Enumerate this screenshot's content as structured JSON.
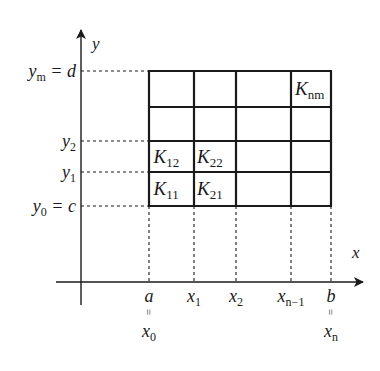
{
  "axes": {
    "x_label": "x",
    "y_label": "y"
  },
  "y_ticks": [
    {
      "name": "ym",
      "base": "y",
      "sub": "m",
      "suffix": " = d"
    },
    {
      "name": "y2",
      "base": "y",
      "sub": "2",
      "suffix": ""
    },
    {
      "name": "y1",
      "base": "y",
      "sub": "1",
      "suffix": ""
    },
    {
      "name": "y0",
      "base": "y",
      "sub": "0",
      "suffix": " = c"
    }
  ],
  "x_ticks": [
    {
      "name": "a",
      "base": "a",
      "sub": "",
      "below": {
        "eq": "=",
        "base": "x",
        "sub": "0"
      }
    },
    {
      "name": "x1",
      "base": "x",
      "sub": "1"
    },
    {
      "name": "x2",
      "base": "x",
      "sub": "2"
    },
    {
      "name": "xn-1",
      "base": "x",
      "sub": "n−1"
    },
    {
      "name": "b",
      "base": "b",
      "sub": "",
      "below": {
        "eq": "=",
        "base": "x",
        "sub": "n"
      }
    }
  ],
  "grid": {
    "columns": 4,
    "rows": 4
  },
  "cells": [
    {
      "name": "K11",
      "base": "K",
      "sub": "11",
      "col": 0,
      "row": 0
    },
    {
      "name": "K21",
      "base": "K",
      "sub": "21",
      "col": 1,
      "row": 0
    },
    {
      "name": "K12",
      "base": "K",
      "sub": "12",
      "col": 0,
      "row": 1
    },
    {
      "name": "K22",
      "base": "K",
      "sub": "22",
      "col": 1,
      "row": 1
    },
    {
      "name": "Knm",
      "base": "K",
      "sub": "nm",
      "col": 3,
      "row": 3
    }
  ],
  "colors": {
    "ink": "#1a1a1a",
    "background": "#ffffff"
  }
}
